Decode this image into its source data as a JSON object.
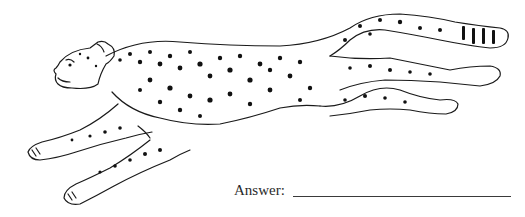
{
  "figure": {
    "stroke_color": "#1a1a1a",
    "background": "#ffffff"
  },
  "answer": {
    "label": "Answer:",
    "value": ""
  }
}
